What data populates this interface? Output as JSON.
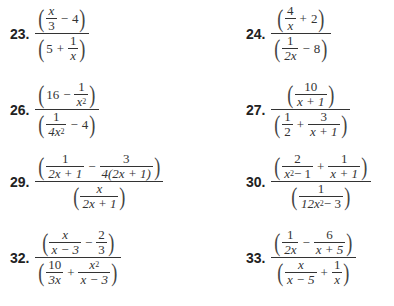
{
  "problems": [
    {
      "label": "23.",
      "numerator": "(x/3 − 4)",
      "denominator": "(5 + 1/x)"
    },
    {
      "label": "24.",
      "numerator": "(4/x + 2)",
      "denominator": "(1/(2x) − 8)"
    },
    {
      "label": "26.",
      "numerator": "(16 − 1/x²)",
      "denominator": "(1/(4x²) − 4)"
    },
    {
      "label": "27.",
      "numerator": "(10/(x + 1))",
      "denominator": "(1/2 + 3/(x + 1))"
    },
    {
      "label": "29.",
      "numerator": "(1/(2x + 1) − 3/(4(2x + 1)))",
      "denominator": "(x/(2x + 1))"
    },
    {
      "label": "30.",
      "numerator": "(2/(x² − 1) + 1/(x + 1))",
      "denominator": "(1/(12x² − 3))"
    },
    {
      "label": "32.",
      "numerator": "(x/(x − 3) − 2/3)",
      "denominator": "(10/(3x) + x²/(x − 3))"
    },
    {
      "label": "33.",
      "numerator": "(1/(2x) − 6/(x + 5))",
      "denominator": "(x/(x − 5) + 1/x)"
    }
  ],
  "t": {
    "x": "x",
    "3": "3",
    "4": "4",
    "5": "5",
    "1": "1",
    "2": "2",
    "8": "8",
    "6": "6",
    "16": "16",
    "10": "10",
    "minus": "−",
    "plus": "+",
    "lp": "(",
    "rp": ")",
    "2x": "2x",
    "4x": "4x",
    "3x": "3x",
    "12x": "12x",
    "x+1": "x + 1",
    "x-1": " − 1",
    "x-3": "x − 3",
    "x+5": "x + 5",
    "x-5": "x − 5",
    "2x+1": "2x + 1",
    "4(2x+1)": "4(2x + 1)",
    "m3": " − 3",
    "sq": "2"
  }
}
